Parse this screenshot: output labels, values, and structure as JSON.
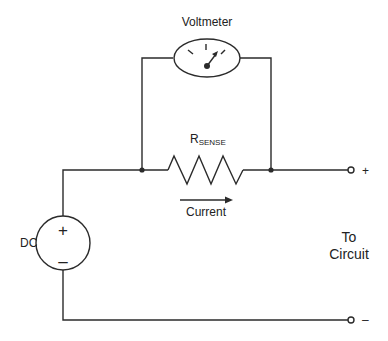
{
  "diagram": {
    "labels": {
      "voltmeter": "Voltmeter",
      "rsense_main": "R",
      "rsense_sub": "SENSE",
      "current": "Current",
      "source": "DC",
      "source_plus": "+",
      "source_minus": "–",
      "to_line1": "To",
      "to_line2": "Circuit",
      "terminal_plus": "+",
      "terminal_minus": "–"
    },
    "components": [
      {
        "id": "dc-source",
        "type": "dc-voltage-source",
        "label": "DC"
      },
      {
        "id": "rsense",
        "type": "resistor",
        "label": "RSENSE"
      },
      {
        "id": "voltmeter",
        "type": "voltmeter",
        "label": "Voltmeter",
        "connection": "parallel to RSENSE"
      },
      {
        "id": "terminal-plus",
        "type": "output-terminal",
        "label": "+"
      },
      {
        "id": "terminal-minus",
        "type": "output-terminal",
        "label": "–"
      }
    ],
    "colors": {
      "line": "#2b2b2b",
      "background": "#ffffff"
    }
  }
}
